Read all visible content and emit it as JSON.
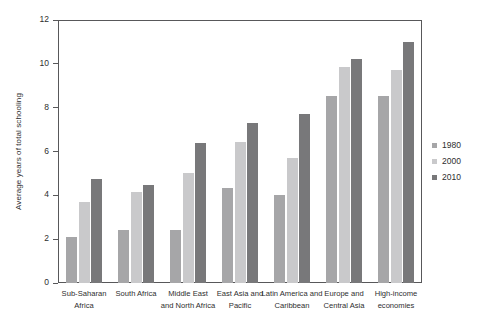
{
  "chart_data": {
    "type": "bar",
    "title": "",
    "subtitle": "",
    "xlabel": "",
    "ylabel": "Average years of total schooling",
    "ylim": [
      0,
      12
    ],
    "yticks": [
      0,
      2,
      4,
      6,
      8,
      10,
      12
    ],
    "grid": false,
    "legend_position": "right",
    "categories": [
      "Sub-Saharan Africa",
      "South Africa",
      "Middle East and North Africa",
      "East Asia and Pacific",
      "Latin America and Caribbean",
      "Europe and Central Asia",
      "High-income economies"
    ],
    "category_lines": [
      [
        "Sub-Saharan",
        "Africa"
      ],
      [
        "South Africa"
      ],
      [
        "Middle East",
        "and North Africa"
      ],
      [
        "East Asia and",
        "Pacific"
      ],
      [
        "Latin America and",
        "Caribbean"
      ],
      [
        "Europe and",
        "Central Asia"
      ],
      [
        "High-income",
        "economies"
      ]
    ],
    "series": [
      {
        "name": "1980",
        "color": "#a6a6a8",
        "values": [
          2.1,
          2.4,
          2.4,
          4.35,
          4.0,
          8.55,
          8.55
        ]
      },
      {
        "name": "2000",
        "color": "#c9c9cb",
        "values": [
          3.7,
          4.15,
          5.0,
          6.45,
          5.7,
          9.85,
          9.7
        ]
      },
      {
        "name": "2010",
        "color": "#78787a",
        "values": [
          4.75,
          4.45,
          6.4,
          7.3,
          7.7,
          10.2,
          11.0
        ]
      }
    ]
  },
  "axis": {
    "y_tick_labels": [
      "0",
      "2",
      "4",
      "6",
      "8",
      "10",
      "12"
    ]
  },
  "legend": {
    "items": [
      {
        "label": "1980",
        "color": "#a6a6a8"
      },
      {
        "label": "2000",
        "color": "#c9c9cb"
      },
      {
        "label": "2010",
        "color": "#78787a"
      }
    ]
  }
}
